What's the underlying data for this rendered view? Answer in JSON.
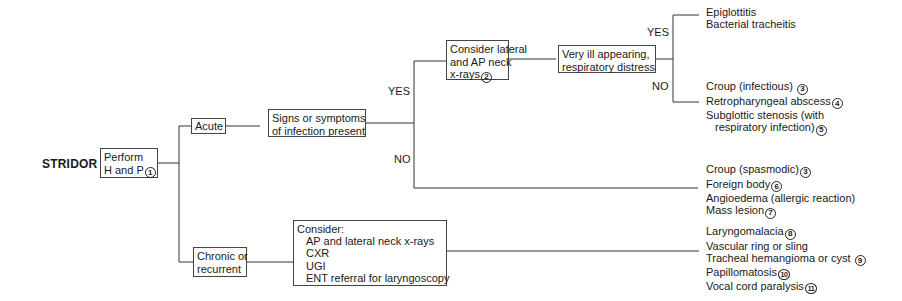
{
  "title": "STRIDOR",
  "nodes": {
    "perform": {
      "lines": [
        "Perform",
        "H and P"
      ],
      "ref": "1"
    },
    "acute": {
      "label": "Acute"
    },
    "chronic": {
      "lines": [
        "Chronic or",
        "recurrent"
      ]
    },
    "signs": {
      "lines": [
        "Signs or symptoms",
        "of infection present"
      ]
    },
    "consider_xray": {
      "lines": [
        "Consider lateral",
        "and AP neck",
        "x-rays"
      ],
      "ref": "2"
    },
    "very_ill": {
      "lines": [
        "Very ill appearing,",
        "respiratory distress"
      ]
    },
    "consider_chronic": {
      "heading": "Consider:",
      "items": [
        "AP and lateral neck x-rays",
        "CXR",
        "UGI",
        "ENT referral for laryngoscopy"
      ]
    }
  },
  "branch_labels": {
    "infection_yes": "YES",
    "infection_no": "NO",
    "ill_yes": "YES",
    "ill_no": "NO"
  },
  "outcomes": {
    "ill_yes": [
      {
        "text": "Epiglottitis",
        "ref": ""
      },
      {
        "text": "Bacterial tracheitis",
        "ref": ""
      }
    ],
    "ill_no": [
      {
        "text": "Croup (infectious)",
        "ref": "3"
      },
      {
        "text": "Retropharyngeal abscess",
        "ref": "4"
      },
      {
        "text": "Subglottic stenosis (with",
        "ref": ""
      },
      {
        "text": "respiratory infection)",
        "ref": "5",
        "indent": true
      }
    ],
    "infection_no": [
      {
        "text": "Croup (spasmodic)",
        "ref": "3"
      },
      {
        "text": "Foreign body",
        "ref": "6"
      },
      {
        "text": "Angioedema (allergic reaction)",
        "ref": ""
      },
      {
        "text": "Mass lesion",
        "ref": "7"
      }
    ],
    "chronic": [
      {
        "text": "Laryngomalacia",
        "ref": "8"
      },
      {
        "text": "Vascular ring or sling",
        "ref": ""
      },
      {
        "text": "Tracheal hemangioma or cyst",
        "ref": "9"
      },
      {
        "text": "Papillomatosis",
        "ref": "10"
      },
      {
        "text": "Vocal cord paralysis",
        "ref": "11"
      }
    ]
  },
  "colors": {
    "line": "#333333",
    "text": "#1a1a1a",
    "box_border": "#444444"
  }
}
